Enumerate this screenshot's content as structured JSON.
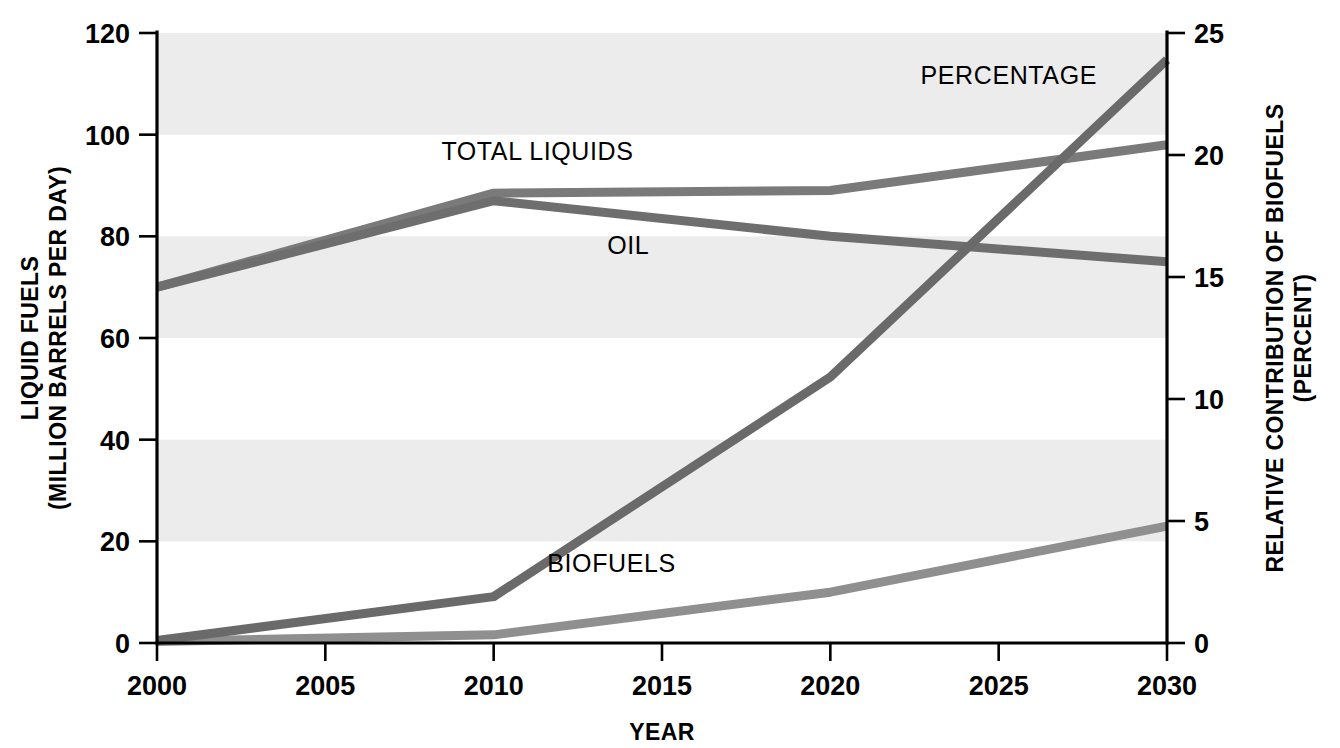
{
  "chart_data": {
    "type": "line",
    "title": "",
    "xlabel": "YEAR",
    "ylabel": "LIQUID FUELS\n(MILLION BARRELS PER DAY)",
    "ylabel_line1": "LIQUID FUELS",
    "ylabel_line2": "(MILLION BARRELS PER DAY)",
    "y2label_line1": "RELATIVE CONTRIBUTION OF BIOFUELS",
    "y2label_line2": "(PERCENT)",
    "xlim": [
      2000,
      2030
    ],
    "ylim": [
      0,
      120
    ],
    "y2lim": [
      0,
      25
    ],
    "xticks": [
      "2000",
      "2005",
      "2010",
      "2015",
      "2020",
      "2025",
      "2030"
    ],
    "xtick_values": [
      2000,
      2005,
      2010,
      2015,
      2020,
      2025,
      2030
    ],
    "yticks": [
      "0",
      "20",
      "40",
      "60",
      "80",
      "100",
      "120"
    ],
    "ytick_values": [
      0,
      20,
      40,
      60,
      80,
      100,
      120
    ],
    "y2ticks": [
      "0",
      "5",
      "10",
      "15",
      "20",
      "25"
    ],
    "y2tick_values": [
      0,
      5,
      10,
      15,
      20,
      25
    ],
    "grid": false,
    "banded_background": true,
    "band_ranges": [
      [
        20,
        40
      ],
      [
        60,
        80
      ],
      [
        100,
        120
      ]
    ],
    "legend_position": "inline-labels",
    "series": [
      {
        "name": "TOTAL LIQUIDS",
        "axis": "left",
        "color": "#7a7a7a",
        "label_x": 2011.3,
        "label_y": 95,
        "x": [
          2000,
          2010,
          2020,
          2030
        ],
        "values": [
          70,
          88.5,
          89,
          98
        ]
      },
      {
        "name": "OIL",
        "axis": "left",
        "color": "#6e6e6e",
        "label_x": 2014.0,
        "label_y": 76.5,
        "x": [
          2000,
          2010,
          2020,
          2030
        ],
        "values": [
          70,
          87,
          80,
          75
        ]
      },
      {
        "name": "BIOFUELS",
        "axis": "left",
        "color": "#8f8f8f",
        "label_x": 2013.5,
        "label_y": 14,
        "x": [
          2000,
          2010,
          2020,
          2030
        ],
        "values": [
          0.3,
          1.6,
          10,
          23
        ]
      },
      {
        "name": "PERCENTAGE",
        "axis": "right",
        "color": "#6a6a6a",
        "label_x": 2025.3,
        "label_y": 22.9,
        "x": [
          2000,
          2010,
          2020,
          2030
        ],
        "values": [
          0.1,
          1.9,
          10.9,
          23.9
        ]
      }
    ]
  },
  "colors": {
    "band": "#ececec",
    "axis": "#000000",
    "text": "#000000",
    "line_total_liquids": "#7a7a7a",
    "line_oil": "#6e6e6e",
    "line_biofuels": "#8f8f8f",
    "line_percentage": "#6a6a6a"
  }
}
